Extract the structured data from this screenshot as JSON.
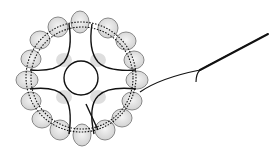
{
  "diagram": {
    "type": "tatting-motif-illustration",
    "outer_ring": {
      "oval_count": 16,
      "center": [
        80,
        75
      ],
      "radius": 62
    },
    "inner_lobes": {
      "count": 4
    },
    "colors": {
      "oval_fill": "#e0e0e0",
      "oval_stroke": "#7a7a7a",
      "line": "#111111",
      "inner_fill": "#d8d8d8"
    }
  }
}
